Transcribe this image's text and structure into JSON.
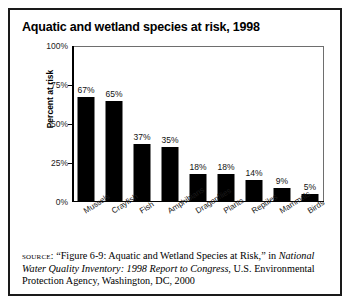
{
  "figure": {
    "title": "Aquatic and wetland species at risk, 1998"
  },
  "chart_data": {
    "type": "bar",
    "title": "Aquatic and wetland species at risk, 1998",
    "xlabel": "",
    "ylabel": "Percent at risk",
    "ylim": [
      0,
      100
    ],
    "ytick_labels": [
      "100%",
      "75%",
      "50%",
      "25%",
      "0%"
    ],
    "ytick_values": [
      100,
      75,
      50,
      25,
      0
    ],
    "grid": false,
    "legend": "none",
    "bar_color": "#000000",
    "categories": [
      "Mussels",
      "Crayfish",
      "Fish",
      "Amphibians",
      "Dragonflies",
      "Plants",
      "Reptiles",
      "Mammals",
      "Birds"
    ],
    "values": [
      67,
      65,
      37,
      35,
      18,
      18,
      14,
      9,
      5
    ],
    "value_labels": [
      "67%",
      "65%",
      "37%",
      "35%",
      "18%",
      "18%",
      "14%",
      "9%",
      "5%"
    ]
  },
  "source": {
    "label": "source:",
    "line1": " “Figure 6-9: Aquatic and Wetland Species at Risk,” in",
    "italic_title": "National Water Quality Inventory: 1998 Report to Congress,",
    "line3": " U.S. Environmental Protection Agency, Washington, DC, 2000"
  }
}
